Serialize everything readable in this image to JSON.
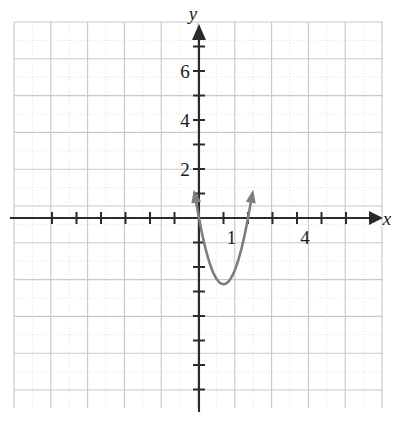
{
  "chart_data": {
    "type": "line",
    "title": "",
    "subtitle": "",
    "xlabel": "x",
    "ylabel": "y",
    "xlim": [
      -7.6,
      7.6
    ],
    "ylim": [
      -8.2,
      8.0
    ],
    "grid": true,
    "minor_grid": true,
    "legend": null,
    "annotations": [],
    "axis_labels": {
      "x": "x",
      "y": "y"
    },
    "x_tick_labels": [
      {
        "value": 1,
        "text": "1"
      },
      {
        "value": 4,
        "text": "4"
      }
    ],
    "y_tick_labels": [
      {
        "value": 2,
        "text": "2"
      },
      {
        "value": 4,
        "text": "4"
      },
      {
        "value": 6,
        "text": "6"
      }
    ],
    "x_ticks": [
      -6,
      -5,
      -4,
      -3,
      -2,
      -1,
      1,
      2,
      3,
      4,
      5,
      6
    ],
    "y_ticks": [
      -7,
      -6,
      -5,
      -4,
      -3,
      -2,
      -1,
      1,
      2,
      3,
      4,
      5,
      6,
      7
    ],
    "tick_spacing": 1,
    "series": [
      {
        "name": "parabola",
        "type": "parabola",
        "color": "#7d7d7d",
        "linewidth": 2.6,
        "vertex": [
          1,
          -2.7
        ],
        "leading_coefficient": 2.7,
        "equation": "y = 2.7(x - 1)^2 - 2.7",
        "roots": [
          0,
          2
        ],
        "y_intercept": 0,
        "arrow_start": true,
        "arrow_end": true,
        "x_range": [
          -0.02,
          2.02
        ],
        "points": [
          [
            -0.02,
            0.08
          ],
          [
            0.1,
            -0.51
          ],
          [
            0.25,
            -1.18
          ],
          [
            0.4,
            -1.73
          ],
          [
            0.55,
            -2.15
          ],
          [
            0.7,
            -2.46
          ],
          [
            0.85,
            -2.64
          ],
          [
            1.0,
            -2.7
          ],
          [
            1.15,
            -2.64
          ],
          [
            1.3,
            -2.46
          ],
          [
            1.45,
            -2.15
          ],
          [
            1.6,
            -1.73
          ],
          [
            1.75,
            -1.18
          ],
          [
            1.9,
            -0.51
          ],
          [
            2.02,
            0.08
          ]
        ]
      }
    ]
  },
  "colors": {
    "curve": "#7d7d7d",
    "axis": "#2b2b2b",
    "grid_major": "#c9c9c9",
    "grid_minor": "#e3e3e3",
    "text": "#1a1a1a",
    "background": "#ffffff"
  },
  "geometry": {
    "origin_x": 199,
    "origin_y": 218,
    "unit_px": 24.5,
    "grid_left": 14,
    "grid_top": 22,
    "grid_right": 383,
    "grid_bottom": 408,
    "grid_cell_px": 36.8
  }
}
